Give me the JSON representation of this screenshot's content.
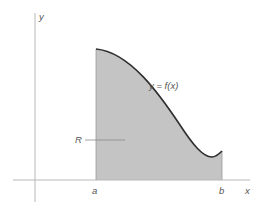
{
  "diagram": {
    "labels": {
      "y_axis": "y",
      "x_axis": "x",
      "curve": "y = f(x)",
      "region": "R",
      "left_bound": "a",
      "right_bound": "b"
    },
    "colors": {
      "axis": "#b8b8b8",
      "curve": "#2e2e2e",
      "fill": "#c4c4c4",
      "leader": "#8a8a8a",
      "text": "#555555"
    }
  }
}
